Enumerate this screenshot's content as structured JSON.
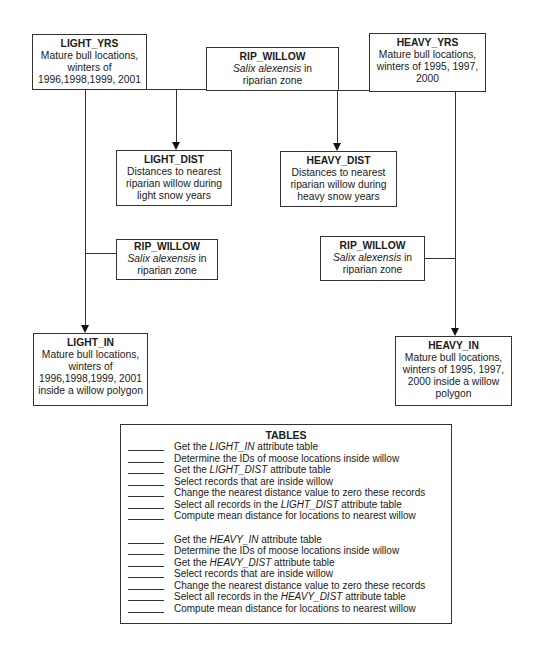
{
  "nodes": {
    "light_yrs": {
      "title": "LIGHT_YRS",
      "lines": [
        "Mature bull locations,",
        "winters of",
        "1996,1998,1999, 2001"
      ]
    },
    "rip_willow_top": {
      "title": "RIP_WILLOW",
      "species": "Salix alexensis",
      "species_suffix": " in",
      "line2": "riparian zone"
    },
    "heavy_yrs": {
      "title": "HEAVY_YRS",
      "lines": [
        "Mature bull locations,",
        "winters of 1995, 1997,",
        "2000"
      ]
    },
    "light_dist": {
      "title": "LIGHT_DIST",
      "lines": [
        "Distances to nearest",
        "riparian willow during",
        "light snow years"
      ]
    },
    "heavy_dist": {
      "title": "HEAVY_DIST",
      "lines": [
        "Distances to nearest",
        "riparian willow during",
        "heavy snow years"
      ]
    },
    "rip_willow_left": {
      "title": "RIP_WILLOW",
      "species": "Salix alexensis",
      "species_suffix": " in",
      "line2": "riparian zone"
    },
    "rip_willow_right": {
      "title": "RIP_WILLOW",
      "species": "Salix alexensis",
      "species_suffix": " in",
      "line2": "riparian zone"
    },
    "light_in": {
      "title": "LIGHT_IN",
      "lines": [
        "Mature bull locations,",
        "winters of",
        "1996,1998,1999, 2001",
        "inside a willow polygon"
      ]
    },
    "heavy_in": {
      "title": "HEAVY_IN",
      "lines": [
        "Mature bull locations,",
        "winters of 1995, 1997,",
        "2000 inside a willow",
        "polygon"
      ]
    }
  },
  "tables": {
    "title": "TABLES",
    "light_steps": [
      {
        "pre": "Get the ",
        "em": "LIGHT_IN",
        "post": " attribute table"
      },
      {
        "pre": " Determine the IDs of moose locations inside willow",
        "em": "",
        "post": ""
      },
      {
        "pre": "Get the ",
        "em": "LIGHT_DIST",
        "post": " attribute table"
      },
      {
        "pre": "Select records that are inside willow",
        "em": "",
        "post": ""
      },
      {
        "pre": "Change the nearest distance value to zero these records",
        "em": "",
        "post": ""
      },
      {
        "pre": "Select all records in the ",
        "em": "LIGHT_DIST",
        "post": " attribute table"
      },
      {
        "pre": "Compute mean distance for locations to nearest willow",
        "em": "",
        "post": ""
      }
    ],
    "heavy_steps": [
      {
        "pre": " Get the ",
        "em": "HEAVY_IN",
        "post": " attribute table"
      },
      {
        "pre": " Determine the IDs of moose locations inside willow",
        "em": "",
        "post": ""
      },
      {
        "pre": " Get the ",
        "em": "HEAVY_DIST",
        "post": " attribute table"
      },
      {
        "pre": " Select records that are inside willow",
        "em": "",
        "post": ""
      },
      {
        "pre": " Change the nearest distance value to zero these records",
        "em": "",
        "post": ""
      },
      {
        "pre": " Select all records in the ",
        "em": "HEAVY_DIST",
        "post": " attribute table"
      },
      {
        "pre": " Compute mean distance for locations to nearest willow",
        "em": "",
        "post": ""
      }
    ]
  }
}
